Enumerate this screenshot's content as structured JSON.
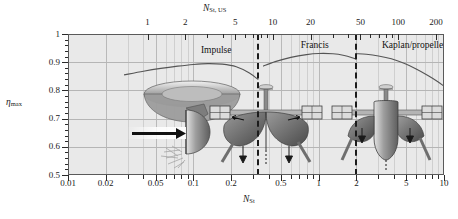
{
  "chart_data": {
    "type": "line",
    "title": "",
    "xlabel": "N_St",
    "xlabel_top": "N_St, US",
    "ylabel": "eta_max",
    "xscale": "log",
    "xlim": [
      0.01,
      10
    ],
    "ylim": [
      0.5,
      1.0
    ],
    "grid": true,
    "legend": "none",
    "x_ticks_bottom": [
      "0.01",
      "0.02",
      "0.05",
      "0.1",
      "0.2",
      "0.5",
      "1",
      "2",
      "5",
      "10"
    ],
    "x_tickvals_bottom": [
      0.01,
      0.02,
      0.05,
      0.1,
      0.2,
      0.5,
      1,
      2,
      5,
      10
    ],
    "x_ticks_top": [
      "1",
      "2",
      "5",
      "10",
      "20",
      "50",
      "100",
      "200"
    ],
    "x_tickvals_top_in_nst": [
      0.0431,
      0.0862,
      0.2155,
      0.431,
      0.862,
      2.155,
      4.31,
      8.62
    ],
    "y_ticks": [
      "0.5",
      "0.6",
      "0.7",
      "0.8",
      "0.9",
      "1"
    ],
    "y_tickvals": [
      0.5,
      0.6,
      0.7,
      0.8,
      0.9,
      1.0
    ],
    "dividers": [
      0.33,
      2.0
    ],
    "series": [
      {
        "name": "Impulse",
        "label": "Impulse",
        "x": [
          0.028,
          0.04,
          0.055,
          0.075,
          0.1,
          0.13,
          0.17,
          0.22,
          0.28,
          0.33
        ],
        "y": [
          0.855,
          0.868,
          0.878,
          0.886,
          0.892,
          0.895,
          0.893,
          0.884,
          0.862,
          0.838
        ]
      },
      {
        "name": "Francis",
        "label": "Francis",
        "x": [
          0.36,
          0.45,
          0.6,
          0.8,
          1.0,
          1.3,
          1.6,
          1.85,
          2.0
        ],
        "y": [
          0.886,
          0.902,
          0.917,
          0.927,
          0.931,
          0.93,
          0.924,
          0.916,
          0.91
        ]
      },
      {
        "name": "Kaplan/propeller",
        "label": "Kaplan/propeller",
        "x": [
          2.0,
          2.4,
          3.0,
          3.8,
          4.8,
          6.0,
          7.5,
          9.0,
          10.0
        ],
        "y": [
          0.93,
          0.928,
          0.922,
          0.912,
          0.896,
          0.876,
          0.852,
          0.83,
          0.815
        ]
      }
    ],
    "annotations": [
      {
        "text": "Impulse",
        "x": 0.115,
        "y": 0.945
      },
      {
        "text": "Francis",
        "x": 0.72,
        "y": 0.962
      },
      {
        "text": "Kaplan/propeller",
        "x": 3.2,
        "y": 0.962
      }
    ],
    "illustrations": [
      {
        "name": "pelton-impulse-turbine",
        "region": "Impulse"
      },
      {
        "name": "francis-turbine",
        "region": "Francis"
      },
      {
        "name": "kaplan-propeller-turbine",
        "region": "Kaplan/propeller"
      }
    ],
    "colors": {
      "plot_background": "#e9e9e9",
      "grid": "#b9b9b9",
      "axis": "#2a2a2a",
      "curve": "#555555",
      "divider": "#1c1c1c"
    }
  },
  "axes": {
    "top_title_base": "N",
    "top_title_sub": "St, US",
    "bottom_title_base": "N",
    "bottom_title_sub": "St",
    "left_title_base": "η",
    "left_title_sub": "max"
  },
  "regions": {
    "impulse": "Impulse",
    "francis": "Francis",
    "kaplan": "Kaplan/propeller"
  }
}
